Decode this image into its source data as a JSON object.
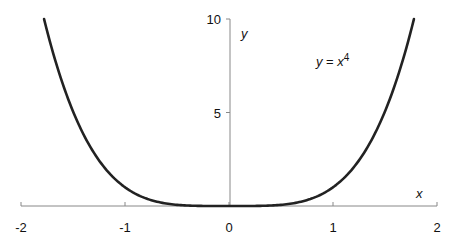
{
  "chart_data": {
    "type": "line",
    "title": "",
    "annotation": {
      "text_var": "y",
      "text_eq": " = ",
      "text_base": "x",
      "text_exp": "4",
      "x": 1.4,
      "y": 7.8
    },
    "xlabel": "x",
    "ylabel": "y",
    "xlim": [
      -2,
      2
    ],
    "ylim": [
      0,
      10
    ],
    "xticks": [
      -2,
      -1,
      0,
      1,
      2
    ],
    "xtick_labels": [
      "-2",
      "-1",
      "0",
      "1",
      "2"
    ],
    "yticks": [
      5,
      10
    ],
    "ytick_labels": [
      "5",
      "10"
    ],
    "grid": false,
    "legend": false,
    "series": [
      {
        "name": "y = x^4",
        "function": "x^4",
        "color": "#222222",
        "x": [
          -1.778,
          -1.6,
          -1.4,
          -1.2,
          -1.0,
          -0.8,
          -0.6,
          -0.4,
          -0.2,
          0,
          0.2,
          0.4,
          0.6,
          0.8,
          1.0,
          1.2,
          1.4,
          1.6,
          1.778
        ],
        "values": [
          10.0,
          6.55,
          3.84,
          2.07,
          1.0,
          0.41,
          0.13,
          0.026,
          0.0016,
          0,
          0.0016,
          0.026,
          0.13,
          0.41,
          1.0,
          2.07,
          3.84,
          6.55,
          10.0
        ]
      }
    ]
  },
  "colors": {
    "curve": "#222222",
    "axis": "#888888",
    "text": "#111111"
  }
}
